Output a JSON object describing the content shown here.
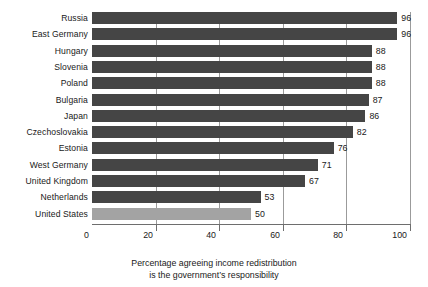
{
  "chart_data": {
    "type": "bar",
    "orientation": "horizontal",
    "title": "",
    "subtitle": "",
    "xlabel": "Percentage agreeing income redistribution is the government's responsibility",
    "ylabel": "",
    "xlim": [
      0,
      100
    ],
    "grid": true,
    "legend": null,
    "categories": [
      "Russia",
      "East Germany",
      "Hungary",
      "Slovenia",
      "Poland",
      "Bulgaria",
      "Japan",
      "Czechoslovakia",
      "Estonia",
      "West Germany",
      "United Kingdom",
      "Netherlands",
      "United States"
    ],
    "values": [
      96,
      96,
      88,
      88,
      88,
      87,
      86,
      82,
      76,
      71,
      67,
      53,
      50
    ],
    "xticks": [
      0,
      20,
      40,
      60,
      80,
      100
    ],
    "xtick_labels": [
      "0",
      "20",
      "40",
      "60",
      "80",
      "100"
    ],
    "highlight_index": 12,
    "colors": {
      "bar": "#454545",
      "bar_highlight": "#a3a3a3",
      "gridline": "#9b9b9b",
      "axis": "#6e6e6e",
      "text": "#191919",
      "background": "#ffffff"
    }
  },
  "caption": {
    "line1": "Percentage agreeing income redistribution",
    "line2": "is the government’s responsibility"
  }
}
